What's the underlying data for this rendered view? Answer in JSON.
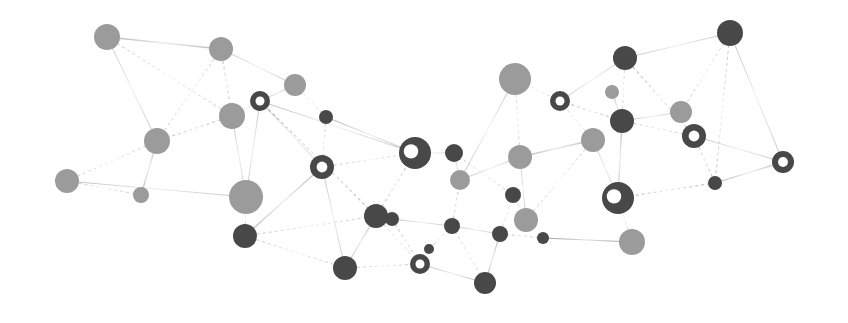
{
  "diagram": {
    "type": "network-graph",
    "width": 848,
    "height": 323,
    "colors": {
      "background": "#ffffff",
      "light_node": "#9b9b9b",
      "dark_node": "#484848",
      "ring_hole": "#ffffff",
      "edge": "#9a9a9a"
    },
    "nodes": [
      {
        "id": "n1",
        "x": 107,
        "y": 37,
        "r": 13,
        "tone": "light",
        "ring": false
      },
      {
        "id": "n2",
        "x": 221,
        "y": 49,
        "r": 12,
        "tone": "light",
        "ring": false
      },
      {
        "id": "n3",
        "x": 295,
        "y": 85,
        "r": 11,
        "tone": "light",
        "ring": false
      },
      {
        "id": "n4",
        "x": 232,
        "y": 116,
        "r": 13,
        "tone": "light",
        "ring": false
      },
      {
        "id": "n5",
        "x": 157,
        "y": 141,
        "r": 13,
        "tone": "light",
        "ring": false
      },
      {
        "id": "n6",
        "x": 67,
        "y": 181,
        "r": 12,
        "tone": "light",
        "ring": false
      },
      {
        "id": "n7",
        "x": 141,
        "y": 195,
        "r": 8,
        "tone": "light",
        "ring": false
      },
      {
        "id": "n8",
        "x": 246,
        "y": 197,
        "r": 17,
        "tone": "light",
        "ring": false
      },
      {
        "id": "n9",
        "x": 245,
        "y": 236,
        "r": 12,
        "tone": "dark",
        "ring": false
      },
      {
        "id": "n10",
        "x": 260,
        "y": 101,
        "r": 10,
        "tone": "dark",
        "ring": true
      },
      {
        "id": "n11",
        "x": 326,
        "y": 117,
        "r": 7,
        "tone": "dark",
        "ring": false
      },
      {
        "id": "n12",
        "x": 322,
        "y": 167,
        "r": 12,
        "tone": "dark",
        "ring": true
      },
      {
        "id": "n13",
        "x": 415,
        "y": 153,
        "r": 16,
        "tone": "dark",
        "ring": true
      },
      {
        "id": "n14",
        "x": 376,
        "y": 216,
        "r": 12,
        "tone": "dark",
        "ring": false
      },
      {
        "id": "n15",
        "x": 392,
        "y": 219,
        "r": 7,
        "tone": "dark",
        "ring": false
      },
      {
        "id": "n16",
        "x": 345,
        "y": 268,
        "r": 12,
        "tone": "dark",
        "ring": false
      },
      {
        "id": "n17",
        "x": 420,
        "y": 264,
        "r": 10,
        "tone": "dark",
        "ring": true
      },
      {
        "id": "n18",
        "x": 429,
        "y": 249,
        "r": 5,
        "tone": "dark",
        "ring": false
      },
      {
        "id": "n19",
        "x": 454,
        "y": 153,
        "r": 9,
        "tone": "dark",
        "ring": false
      },
      {
        "id": "n20",
        "x": 460,
        "y": 180,
        "r": 10,
        "tone": "light",
        "ring": false
      },
      {
        "id": "n21",
        "x": 452,
        "y": 226,
        "r": 8,
        "tone": "dark",
        "ring": false
      },
      {
        "id": "n22",
        "x": 485,
        "y": 283,
        "r": 11,
        "tone": "dark",
        "ring": false
      },
      {
        "id": "n23",
        "x": 513,
        "y": 195,
        "r": 8,
        "tone": "dark",
        "ring": false
      },
      {
        "id": "n24",
        "x": 500,
        "y": 234,
        "r": 8,
        "tone": "dark",
        "ring": false
      },
      {
        "id": "n25",
        "x": 526,
        "y": 220,
        "r": 12,
        "tone": "light",
        "ring": false
      },
      {
        "id": "n26",
        "x": 543,
        "y": 238,
        "r": 6,
        "tone": "dark",
        "ring": false
      },
      {
        "id": "n27",
        "x": 520,
        "y": 157,
        "r": 12,
        "tone": "light",
        "ring": false
      },
      {
        "id": "n28",
        "x": 515,
        "y": 79,
        "r": 16,
        "tone": "light",
        "ring": false
      },
      {
        "id": "n29",
        "x": 560,
        "y": 101,
        "r": 10,
        "tone": "dark",
        "ring": true
      },
      {
        "id": "n30",
        "x": 612,
        "y": 92,
        "r": 7,
        "tone": "light",
        "ring": false
      },
      {
        "id": "n31",
        "x": 625,
        "y": 58,
        "r": 12,
        "tone": "dark",
        "ring": false
      },
      {
        "id": "n32",
        "x": 593,
        "y": 140,
        "r": 12,
        "tone": "light",
        "ring": false
      },
      {
        "id": "n33",
        "x": 622,
        "y": 121,
        "r": 12,
        "tone": "dark",
        "ring": false
      },
      {
        "id": "n34",
        "x": 681,
        "y": 112,
        "r": 11,
        "tone": "light",
        "ring": false
      },
      {
        "id": "n35",
        "x": 694,
        "y": 136,
        "r": 12,
        "tone": "dark",
        "ring": true
      },
      {
        "id": "n36",
        "x": 730,
        "y": 33,
        "r": 13,
        "tone": "dark",
        "ring": false
      },
      {
        "id": "n37",
        "x": 783,
        "y": 162,
        "r": 11,
        "tone": "dark",
        "ring": true
      },
      {
        "id": "n38",
        "x": 715,
        "y": 183,
        "r": 7,
        "tone": "dark",
        "ring": false
      },
      {
        "id": "n39",
        "x": 618,
        "y": 198,
        "r": 16,
        "tone": "dark",
        "ring": true
      },
      {
        "id": "n40",
        "x": 632,
        "y": 242,
        "r": 13,
        "tone": "light",
        "ring": false
      }
    ],
    "edges": [
      [
        "n1",
        "n2"
      ],
      [
        "n1",
        "n4"
      ],
      [
        "n1",
        "n5"
      ],
      [
        "n2",
        "n4"
      ],
      [
        "n2",
        "n3"
      ],
      [
        "n2",
        "n5"
      ],
      [
        "n3",
        "n10"
      ],
      [
        "n3",
        "n11"
      ],
      [
        "n4",
        "n10"
      ],
      [
        "n4",
        "n5"
      ],
      [
        "n4",
        "n8"
      ],
      [
        "n5",
        "n6"
      ],
      [
        "n5",
        "n7"
      ],
      [
        "n6",
        "n7"
      ],
      [
        "n6",
        "n8"
      ],
      [
        "n8",
        "n9"
      ],
      [
        "n8",
        "n10"
      ],
      [
        "n9",
        "n14"
      ],
      [
        "n9",
        "n12"
      ],
      [
        "n9",
        "n16"
      ],
      [
        "n10",
        "n12"
      ],
      [
        "n10",
        "n14"
      ],
      [
        "n10",
        "n13"
      ],
      [
        "n11",
        "n12"
      ],
      [
        "n11",
        "n13"
      ],
      [
        "n12",
        "n13"
      ],
      [
        "n12",
        "n16"
      ],
      [
        "n13",
        "n14"
      ],
      [
        "n13",
        "n19"
      ],
      [
        "n14",
        "n15"
      ],
      [
        "n14",
        "n16"
      ],
      [
        "n14",
        "n17"
      ],
      [
        "n15",
        "n21"
      ],
      [
        "n15",
        "n17"
      ],
      [
        "n17",
        "n18"
      ],
      [
        "n18",
        "n21"
      ],
      [
        "n19",
        "n20"
      ],
      [
        "n19",
        "n23"
      ],
      [
        "n20",
        "n27"
      ],
      [
        "n20",
        "n21"
      ],
      [
        "n21",
        "n24"
      ],
      [
        "n21",
        "n22"
      ],
      [
        "n22",
        "n24"
      ],
      [
        "n23",
        "n24"
      ],
      [
        "n23",
        "n25"
      ],
      [
        "n24",
        "n26"
      ],
      [
        "n25",
        "n27"
      ],
      [
        "n27",
        "n28"
      ],
      [
        "n27",
        "n32"
      ],
      [
        "n28",
        "n29"
      ],
      [
        "n28",
        "n20"
      ],
      [
        "n29",
        "n33"
      ],
      [
        "n29",
        "n31"
      ],
      [
        "n29",
        "n32"
      ],
      [
        "n30",
        "n33"
      ],
      [
        "n31",
        "n33"
      ],
      [
        "n31",
        "n36"
      ],
      [
        "n31",
        "n35"
      ],
      [
        "n33",
        "n34"
      ],
      [
        "n33",
        "n35"
      ],
      [
        "n33",
        "n39"
      ],
      [
        "n34",
        "n36"
      ],
      [
        "n35",
        "n37"
      ],
      [
        "n35",
        "n38"
      ],
      [
        "n36",
        "n37"
      ],
      [
        "n36",
        "n38"
      ],
      [
        "n38",
        "n37"
      ],
      [
        "n39",
        "n40"
      ],
      [
        "n39",
        "n32"
      ],
      [
        "n39",
        "n38"
      ],
      [
        "n40",
        "n26"
      ],
      [
        "n32",
        "n25"
      ],
      [
        "n22",
        "n17"
      ],
      [
        "n16",
        "n17"
      ],
      [
        "n26",
        "n40"
      ]
    ]
  }
}
